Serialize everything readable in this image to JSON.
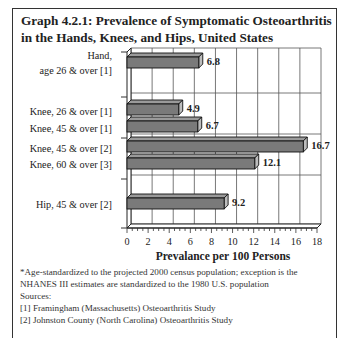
{
  "title": "Graph 4.2.1: Prevalence of Symptomatic Osteoarthritis in the Hands, Knees, and Hips, United States",
  "chart_data": {
    "type": "bar",
    "orientation": "horizontal",
    "style": "3d",
    "title": "Graph 4.2.1: Prevalence of Symptomatic Osteoarthritis in the Hands, Knees, and Hips, United States",
    "categories": [
      "Hand, age 26 & over [1]",
      "Knee, 26 & over [1]",
      "Knee, 45 & over [1]",
      "Knee, 45 & over [2]",
      "Knee, 60 & over [3]",
      "Hip, 45 & over [2]"
    ],
    "category_lines": [
      [
        "Hand,",
        "age 26 & over [1]"
      ],
      [
        "Knee, 26 & over [1]"
      ],
      [
        "Knee, 45 & over [1]"
      ],
      [
        "Knee, 45 & over [2]"
      ],
      [
        "Knee, 60 & over [3]"
      ],
      [
        "Hip, 45 & over [2]"
      ]
    ],
    "values": [
      6.8,
      4.9,
      6.7,
      16.7,
      12.1,
      9.2
    ],
    "value_labels": [
      "6.8",
      "4.9",
      "6.7",
      "16.7",
      "12.1",
      "9.2"
    ],
    "xlabel": "Prevalance per 100 Persons",
    "ylabel": "",
    "xlim": [
      0,
      18
    ],
    "xticks": [
      0,
      2,
      4,
      6,
      8,
      10,
      12,
      14,
      16,
      18
    ],
    "grid": true,
    "legend": null,
    "bar_color": "#7a7a7a"
  },
  "footnotes": {
    "note": "*Age-standardized to the projected 2000 census population; exception is the",
    "note_cont": "NHANES III estimates are standardized to the 1980 U.S. population",
    "sources_label": "Sources:",
    "sources": [
      "[1] Framingham (Massachusetts) Osteoarthritis Study",
      "[2] Johnston County (North Carolina) Osteoarthritis Study"
    ]
  }
}
